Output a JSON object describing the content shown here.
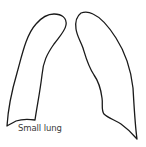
{
  "diagram": {
    "label": "Small lung",
    "stroke_color": "#1a1a1a",
    "fill_color": "#ffffff",
    "label_color": "#3a3a3a",
    "shapes": [
      {
        "name": "left-lung-outline"
      },
      {
        "name": "right-lung-outline"
      }
    ]
  }
}
